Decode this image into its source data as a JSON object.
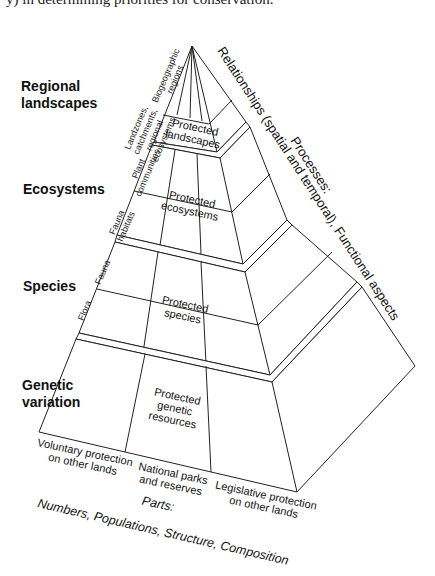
{
  "caption_fragment": "y) in determining priorities for conservation.",
  "levels": [
    {
      "label": "Regional\nlandscapes",
      "sub_labels": [
        "Biogeographic\nregions",
        "Landzones,\ncatchments,\nregional\necosystems"
      ],
      "protected": "Protected\nlandscapes"
    },
    {
      "label": "Ecosystems",
      "sub_labels": [
        "Plant\ncommunities",
        "Fauna\nhabitats"
      ],
      "protected": "Protected\necosystems"
    },
    {
      "label": "Species",
      "sub_labels": [
        "Fauna",
        "Flora"
      ],
      "protected": "Protected\nspecies"
    },
    {
      "label": "Genetic\nvariation",
      "sub_labels": [],
      "protected": "Protected\ngenetic\nresources"
    }
  ],
  "base_columns": [
    "Voluntary protection\non other lands",
    "National parks\nand reserves",
    "Legislative protection\non other lands"
  ],
  "side_axis": {
    "relationships": "Relationships (spatial and temporal), Functional aspects",
    "processes": "Processes:"
  },
  "bottom_axis": {
    "title": "Parts:",
    "items": "Numbers, Populations, Structure, Composition"
  }
}
